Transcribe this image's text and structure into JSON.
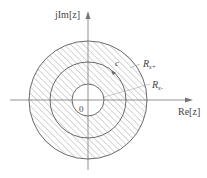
{
  "diagram": {
    "axes": {
      "imag_label": "jIm[z]",
      "real_label": "Re[z]",
      "origin_label": "0"
    },
    "labels": {
      "contour": "c",
      "outer_radius": "R",
      "outer_radius_sub": "x+",
      "inner_radius": "R",
      "inner_radius_sub": "x-"
    },
    "circles": [
      {
        "name": "outer-boundary",
        "radius": 59
      },
      {
        "name": "contour-c",
        "radius": 38
      },
      {
        "name": "inner-boundary",
        "radius": 16
      }
    ],
    "colors": {
      "line": "#6a6a6a",
      "hatch": "#9a9a9a",
      "text": "#444444"
    }
  }
}
